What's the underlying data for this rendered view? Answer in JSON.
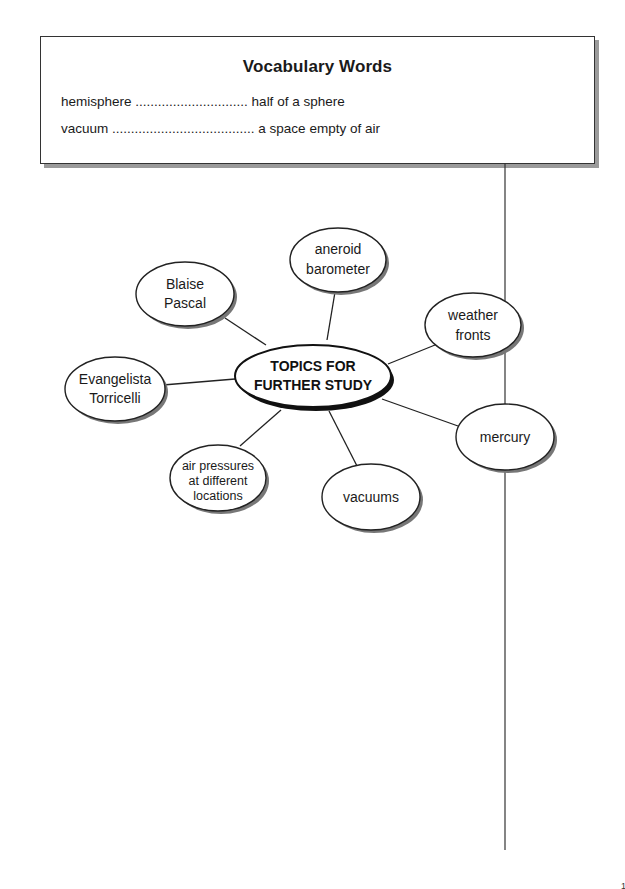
{
  "vocabulary": {
    "title": "Vocabulary Words",
    "entries": [
      {
        "term": "hemisphere",
        "dots": "..............................",
        "definition": "half of a sphere"
      },
      {
        "term": "vacuum",
        "dots": "......................................",
        "definition": "a space empty of air"
      }
    ]
  },
  "concept_map": {
    "center": {
      "line1": "TOPICS FOR",
      "line2": "FURTHER STUDY"
    },
    "nodes": [
      {
        "id": "blaise-pascal",
        "lines": [
          "Blaise",
          "Pascal"
        ]
      },
      {
        "id": "aneroid-barometer",
        "lines": [
          "aneroid",
          "barometer"
        ]
      },
      {
        "id": "weather-fronts",
        "lines": [
          "weather",
          "fronts"
        ]
      },
      {
        "id": "evangelista-torricelli",
        "lines": [
          "Evangelista",
          "Torricelli"
        ]
      },
      {
        "id": "mercury",
        "lines": [
          "mercury"
        ]
      },
      {
        "id": "air-pressures",
        "lines": [
          "air pressures",
          "at different",
          "locations"
        ]
      },
      {
        "id": "vacuums",
        "lines": [
          "vacuums"
        ]
      }
    ]
  },
  "page_number": "1"
}
